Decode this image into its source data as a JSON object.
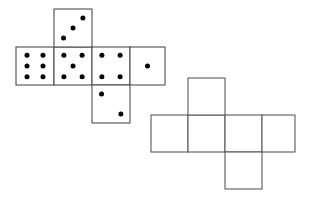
{
  "figure": {
    "canvas": {
      "width": 312,
      "height": 201
    },
    "style": {
      "background_color": "#ffffff",
      "stroke_color_dice": "#4d4d4d",
      "stroke_color_blank": "#595959",
      "face_fill": "#ffffff",
      "pip_color": "#000000",
      "stroke_width": 1.1,
      "pip_radius": 2.5
    },
    "nets": [
      {
        "id": "dice-net",
        "label": "Dice net",
        "has_pips": true,
        "face_size": 38,
        "faces": [
          {
            "id": "face-six",
            "name": "six-face",
            "pip_count": 6,
            "x": 16,
            "y": 47,
            "w": 38,
            "h": 38,
            "pips": [
              [
                0.29,
                0.22
              ],
              [
                0.71,
                0.22
              ],
              [
                0.29,
                0.5
              ],
              [
                0.71,
                0.5
              ],
              [
                0.29,
                0.78
              ],
              [
                0.71,
                0.78
              ]
            ]
          },
          {
            "id": "face-five",
            "name": "five-face",
            "pip_count": 5,
            "x": 54,
            "y": 47,
            "w": 38,
            "h": 38,
            "pips": [
              [
                0.26,
                0.22
              ],
              [
                0.74,
                0.22
              ],
              [
                0.5,
                0.5
              ],
              [
                0.26,
                0.78
              ],
              [
                0.74,
                0.78
              ]
            ]
          },
          {
            "id": "face-four",
            "name": "four-face",
            "pip_count": 4,
            "x": 92,
            "y": 47,
            "w": 38,
            "h": 38,
            "pips": [
              [
                0.26,
                0.22
              ],
              [
                0.74,
                0.22
              ],
              [
                0.26,
                0.78
              ],
              [
                0.74,
                0.78
              ]
            ]
          },
          {
            "id": "face-one",
            "name": "one-face",
            "pip_count": 1,
            "x": 130,
            "y": 47,
            "w": 35,
            "h": 38,
            "pips": [
              [
                0.5,
                0.5
              ]
            ]
          },
          {
            "id": "face-three",
            "name": "three-face",
            "pip_count": 3,
            "x": 54,
            "y": 9,
            "w": 38,
            "h": 38,
            "pips": [
              [
                0.25,
                0.76
              ],
              [
                0.5,
                0.5
              ],
              [
                0.76,
                0.24
              ]
            ]
          },
          {
            "id": "face-two",
            "name": "two-face",
            "pip_count": 2,
            "x": 92,
            "y": 85,
            "w": 38,
            "h": 38,
            "pips": [
              [
                0.25,
                0.24
              ],
              [
                0.76,
                0.76
              ]
            ]
          }
        ]
      },
      {
        "id": "blank-net",
        "label": "Blank net",
        "has_pips": false,
        "face_size": 37,
        "faces": [
          {
            "id": "blank-left",
            "name": "blank-left-face",
            "x": 151,
            "y": 115,
            "w": 37,
            "h": 37,
            "pips": []
          },
          {
            "id": "blank-mid1",
            "name": "blank-middle-face",
            "x": 188,
            "y": 115,
            "w": 37,
            "h": 37,
            "pips": []
          },
          {
            "id": "blank-mid2",
            "name": "blank-center-face",
            "x": 225,
            "y": 115,
            "w": 37,
            "h": 37,
            "pips": []
          },
          {
            "id": "blank-right",
            "name": "blank-right-face",
            "x": 262,
            "y": 115,
            "w": 33,
            "h": 37,
            "pips": []
          },
          {
            "id": "blank-top",
            "name": "blank-top-face",
            "x": 188,
            "y": 78,
            "w": 37,
            "h": 37,
            "pips": []
          },
          {
            "id": "blank-bottom",
            "name": "blank-bottom-face",
            "x": 225,
            "y": 152,
            "w": 37,
            "h": 37,
            "pips": []
          }
        ]
      }
    ]
  }
}
